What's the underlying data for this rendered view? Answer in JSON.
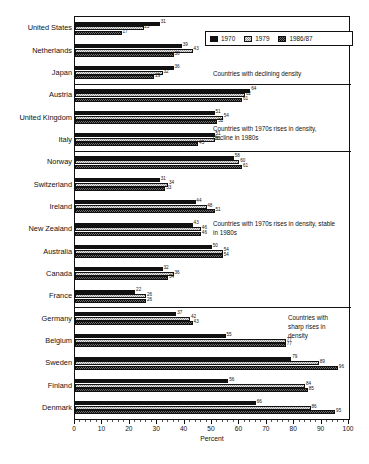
{
  "chart_data": {
    "type": "bar",
    "orientation": "horizontal",
    "title": "",
    "subtitle": "",
    "xlabel": "Percent",
    "ylabel": "",
    "xlim": [
      0,
      100
    ],
    "xticks": [
      0,
      10,
      20,
      30,
      40,
      50,
      60,
      70,
      80,
      90,
      100
    ],
    "xtick_labels": [
      "0",
      "10",
      "20",
      "30",
      "40",
      "50",
      "60",
      "70",
      "80",
      "90",
      "100"
    ],
    "minor_ticks": true,
    "grid": false,
    "legend_position": "top-right",
    "legend": [
      "1970",
      "1979",
      "1986/87"
    ],
    "series": [
      {
        "name": "1970",
        "swatch": "solid-black",
        "color": "#111111"
      },
      {
        "name": "1979",
        "swatch": "light-dotted",
        "color": "#e6e6e6"
      },
      {
        "name": "1986/87",
        "swatch": "dark-hatched",
        "color": "#6b6b6b"
      }
    ],
    "categories": [
      "United States",
      "Netherlands",
      "Japan",
      "Austria",
      "United Kingdom",
      "Italy",
      "Norway",
      "Switzerland",
      "Ireland",
      "New Zealand",
      "Australia",
      "Canada",
      "France",
      "Germany",
      "Belgium",
      "Sweden",
      "Finland",
      "Denmark"
    ],
    "rows": [
      {
        "category": "United States",
        "v1970": 31,
        "v1979": 25,
        "v1986": 17,
        "group": 0
      },
      {
        "category": "Netherlands",
        "v1970": 39,
        "v1979": 43,
        "v1986": 36,
        "group": 0
      },
      {
        "category": "Japan",
        "v1970": 36,
        "v1979": 32,
        "v1986": 29,
        "group": 0
      },
      {
        "category": "Austria",
        "v1970": 64,
        "v1979": 62,
        "v1986": 61,
        "group": 1
      },
      {
        "category": "United Kingdom",
        "v1970": 51,
        "v1979": 54,
        "v1986": 52,
        "group": 1
      },
      {
        "category": "Italy",
        "v1970": 51,
        "v1979": 51,
        "v1986": 45,
        "group": 1
      },
      {
        "category": "Norway",
        "v1970": 58,
        "v1979": 60,
        "v1986": 61,
        "group": 2
      },
      {
        "category": "Switzerland",
        "v1970": 31,
        "v1979": 34,
        "v1986": 33,
        "group": 2
      },
      {
        "category": "Ireland",
        "v1970": 44,
        "v1979": 48,
        "v1986": 51,
        "group": 2
      },
      {
        "category": "New Zealand",
        "v1970": 43,
        "v1979": 46,
        "v1986": 46,
        "group": 2
      },
      {
        "category": "Australia",
        "v1970": 50,
        "v1979": 54,
        "v1986": 54,
        "group": 2
      },
      {
        "category": "Canada",
        "v1970": 32,
        "v1979": 36,
        "v1986": 34,
        "group": 2
      },
      {
        "category": "France",
        "v1970": 22,
        "v1979": 26,
        "v1986": 26,
        "group": 2
      },
      {
        "category": "Germany",
        "v1970": 37,
        "v1979": 42,
        "v1986": 43,
        "group": 3
      },
      {
        "category": "Belgium",
        "v1970": 55,
        "v1979": 77,
        "v1986": 77,
        "group": 3
      },
      {
        "category": "Sweden",
        "v1970": 79,
        "v1979": 89,
        "v1986": 96,
        "group": 3
      },
      {
        "category": "Finland",
        "v1970": 56,
        "v1979": 84,
        "v1986": 85,
        "group": 3
      },
      {
        "category": "Denmark",
        "v1970": 66,
        "v1979": 86,
        "v1986": 95,
        "group": 3
      }
    ],
    "annotations": [
      {
        "text": "Countries with declining density",
        "group": 0
      },
      {
        "text": "Countries with 1970s rises in density, decline in 1980s",
        "group": 1
      },
      {
        "text": "Countries with 1970s rises in density, stable in 1980s",
        "group": 2
      },
      {
        "text": "Countries with sharp rises in density",
        "group": 3
      }
    ]
  }
}
